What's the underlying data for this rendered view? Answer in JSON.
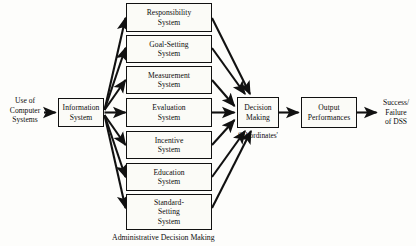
{
  "diagram": {
    "caption": "Administrative Decision Making",
    "stroke_color": "#111111",
    "box_fill": "#fbfbf7",
    "canvas_bg": "#fdfdfb"
  },
  "input": {
    "label_line1": "Use of",
    "label_line2": "Computer",
    "label_line3": "Systems"
  },
  "information_system": {
    "line1": "Information",
    "line2": "System"
  },
  "systems": [
    {
      "line1": "Responsibility",
      "line2": "System",
      "line3": ""
    },
    {
      "line1": "Goal-Setting",
      "line2": "System",
      "line3": ""
    },
    {
      "line1": "Measurement",
      "line2": "System",
      "line3": ""
    },
    {
      "line1": "Evaluation",
      "line2": "System",
      "line3": ""
    },
    {
      "line1": "Incentive",
      "line2": "System",
      "line3": ""
    },
    {
      "line1": "Education",
      "line2": "System",
      "line3": ""
    },
    {
      "line1": "Standard-",
      "line2": "Setting",
      "line3": "System"
    }
  ],
  "decision": {
    "line1": "Decision",
    "line2": "Making",
    "sub_label": "Subordinates'"
  },
  "output": {
    "line1": "Output",
    "line2": "Performances"
  },
  "outcome": {
    "label_line1": "Success/",
    "label_line2": "Failure",
    "label_line3": "of DSS"
  }
}
